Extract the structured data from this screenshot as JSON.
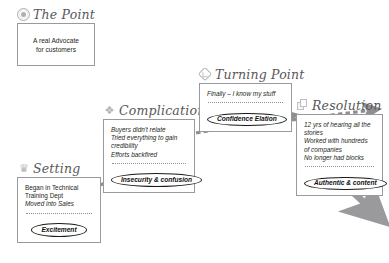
{
  "diagram": {
    "accent_color": "#58585a",
    "ink_color": "#231f20",
    "arrow_color": "#8c8c8e"
  },
  "sections": {
    "point": {
      "heading": "The Point",
      "icon": "seal-icon",
      "lines": [
        "A real Advocate",
        "for customers"
      ]
    },
    "setting": {
      "heading": "Setting",
      "icon": "trophy-icon",
      "lines": [
        "Began in Technical",
        "Training Dept",
        "Moved into Sales"
      ],
      "emotion": "Excitement"
    },
    "complication": {
      "heading": "Complication",
      "icon": "swirl-icon",
      "lines": [
        "Buyers didn't relate",
        "Tried everything to gain",
        "credibility",
        "Efforts backfired"
      ],
      "emotion": "Insecurity & confusion"
    },
    "turning_point": {
      "heading": "Turning Point",
      "icon": "diamond-icon",
      "lines": [
        "Finally – I know my stuff"
      ],
      "emotion": "Confidence Elation"
    },
    "resolution": {
      "heading": "Resolution",
      "icon": "cube-icon",
      "lines": [
        "12 yrs of hearing all the",
        "stories",
        "Worked with hundreds",
        "of companies",
        "No longer had blocks"
      ],
      "emotion": "Authentic & content"
    }
  },
  "connectors": [
    {
      "name": "setting-to-complication",
      "style": "dashed-arrow"
    },
    {
      "name": "complication-to-turning-point",
      "style": "dashed-arrow"
    },
    {
      "name": "turning-point-to-resolution",
      "style": "dashed-arrow"
    },
    {
      "name": "resolution-outflow",
      "style": "solid-arrow"
    }
  ]
}
